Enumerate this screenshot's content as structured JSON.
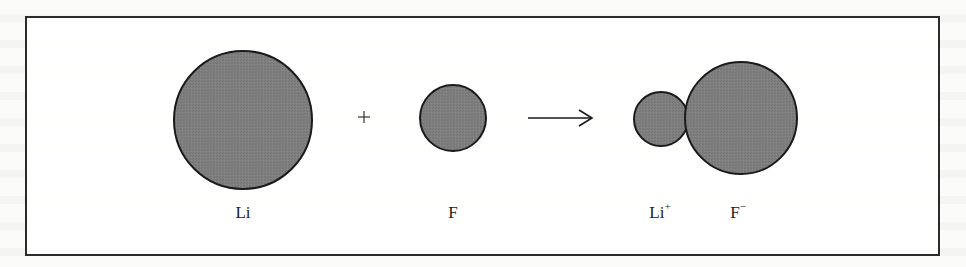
{
  "figure": {
    "colors": {
      "atom_fill": "#7d7d7d",
      "atom_stroke": "#1a1a1a",
      "border": "#2b2b2b",
      "text": "#222222"
    },
    "reactants": [
      {
        "symbol": "Li",
        "label": "Li",
        "charge": "",
        "cx": 243,
        "cy": 120,
        "r": 69
      },
      {
        "symbol": "F",
        "label": "F",
        "charge": "",
        "cx": 453,
        "cy": 118,
        "r": 33
      }
    ],
    "operator": "+",
    "arrow": "→",
    "products": [
      {
        "symbol": "Li",
        "label": "Li",
        "charge": "+",
        "cx": 661,
        "cy": 119,
        "r": 27
      },
      {
        "symbol": "F",
        "label": "F",
        "charge": "−",
        "cx": 741,
        "cy": 118,
        "r": 56
      }
    ]
  }
}
